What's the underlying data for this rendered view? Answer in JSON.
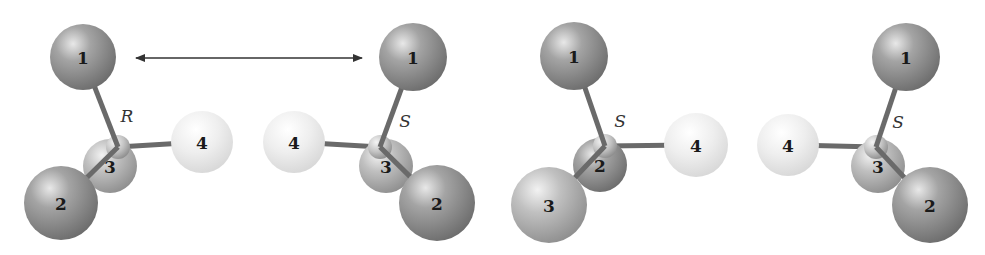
{
  "figure": {
    "colors": {
      "background": "#ffffff",
      "atom_dark": "#8a8a8a",
      "atom_mid": "#a8a8a8",
      "atom_light": "#e6e6e6",
      "bond": "#6a6a6a",
      "arrow": "#333333"
    },
    "mirror_arrow": {
      "x1": 136,
      "y1": 58,
      "x2": 362,
      "y2": 58,
      "style": "double-headed"
    },
    "molecules": [
      {
        "id": "molecule-1",
        "configuration": "R",
        "config_label_pos": [
          127,
          116
        ],
        "center": [
          118,
          147
        ],
        "atoms": [
          {
            "label": "1",
            "x": 83,
            "y": 57,
            "r": 33,
            "shade": "dark"
          },
          {
            "label": "3",
            "x": 110,
            "y": 166,
            "r": 27,
            "shade": "mid"
          },
          {
            "label": "2",
            "x": 61,
            "y": 203,
            "r": 37,
            "shade": "dark"
          },
          {
            "label": "4",
            "x": 202,
            "y": 142,
            "r": 31,
            "shade": "light"
          }
        ],
        "draw_order": [
          "4",
          "3",
          "center",
          "2",
          "1"
        ]
      },
      {
        "id": "molecule-2",
        "configuration": "S",
        "config_label_pos": [
          405,
          121
        ],
        "center": [
          380,
          147
        ],
        "atoms": [
          {
            "label": "1",
            "x": 413,
            "y": 57,
            "r": 34,
            "shade": "dark"
          },
          {
            "label": "3",
            "x": 386,
            "y": 166,
            "r": 27,
            "shade": "mid"
          },
          {
            "label": "2",
            "x": 437,
            "y": 203,
            "r": 38,
            "shade": "dark"
          },
          {
            "label": "4",
            "x": 294,
            "y": 142,
            "r": 31,
            "shade": "light"
          }
        ],
        "draw_order": [
          "4",
          "3",
          "center",
          "2",
          "1"
        ]
      },
      {
        "id": "molecule-3",
        "configuration": "S",
        "config_label_pos": [
          620,
          121
        ],
        "center": [
          605,
          146
        ],
        "atoms": [
          {
            "label": "1",
            "x": 574,
            "y": 56,
            "r": 34,
            "shade": "dark"
          },
          {
            "label": "2",
            "x": 600,
            "y": 165,
            "r": 27,
            "shade": "dark"
          },
          {
            "label": "3",
            "x": 549,
            "y": 205,
            "r": 38,
            "shade": "mid"
          },
          {
            "label": "4",
            "x": 696,
            "y": 145,
            "r": 32,
            "shade": "light"
          }
        ],
        "draw_order": [
          "4",
          "2",
          "center",
          "3",
          "1"
        ]
      },
      {
        "id": "molecule-4",
        "configuration": "S",
        "config_label_pos": [
          898,
          122
        ],
        "center": [
          876,
          147
        ],
        "atoms": [
          {
            "label": "1",
            "x": 906,
            "y": 57,
            "r": 34,
            "shade": "dark"
          },
          {
            "label": "3",
            "x": 878,
            "y": 166,
            "r": 27,
            "shade": "mid"
          },
          {
            "label": "2",
            "x": 930,
            "y": 205,
            "r": 38,
            "shade": "dark"
          },
          {
            "label": "4",
            "x": 788,
            "y": 145,
            "r": 31,
            "shade": "light"
          }
        ],
        "draw_order": [
          "4",
          "3",
          "center",
          "2",
          "1"
        ]
      }
    ]
  }
}
